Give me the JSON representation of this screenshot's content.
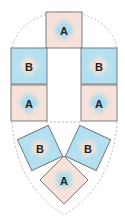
{
  "diagram": {
    "title": "",
    "colors": {
      "tile_a_bg": "#f6e2d8",
      "tile_a_blob": "#a9dbef",
      "tile_b_bg": "#b3e0f1",
      "tile_b_blob": "#f4e1d6",
      "tile_border": "#6f6f78",
      "guide_dashed": "#aaaaaa"
    },
    "tiles": [
      {
        "id": "top",
        "label": "A",
        "type": "A",
        "cx": 64,
        "cy": 30,
        "size": 36,
        "rotation": 0
      },
      {
        "id": "left-upper",
        "label": "B",
        "type": "B",
        "cx": 29,
        "cy": 66,
        "size": 36,
        "rotation": 0
      },
      {
        "id": "right-upper",
        "label": "B",
        "type": "B",
        "cx": 99,
        "cy": 66,
        "size": 36,
        "rotation": 0
      },
      {
        "id": "left-lower",
        "label": "A",
        "type": "A",
        "cx": 29,
        "cy": 103,
        "size": 36,
        "rotation": 0
      },
      {
        "id": "right-lower",
        "label": "A",
        "type": "A",
        "cx": 99,
        "cy": 103,
        "size": 36,
        "rotation": 0
      },
      {
        "id": "bottom-left",
        "label": "B",
        "type": "B",
        "cx": 40,
        "cy": 148,
        "size": 34,
        "rotation": -25
      },
      {
        "id": "bottom-right",
        "label": "B",
        "type": "B",
        "cx": 88,
        "cy": 148,
        "size": 34,
        "rotation": 25
      },
      {
        "id": "bottom-tip",
        "label": "A",
        "type": "A",
        "cx": 64,
        "cy": 180,
        "size": 34,
        "rotation": 45
      }
    ]
  }
}
